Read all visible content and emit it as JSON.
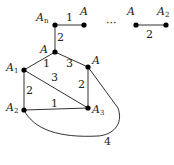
{
  "diagram": {
    "nodes": [
      {
        "id": "An_top",
        "label": "A",
        "sub": "n",
        "x": 55,
        "y": 25,
        "lx": 36,
        "ly": 21
      },
      {
        "id": "A_top",
        "label": "A",
        "sub": "",
        "x": 84,
        "y": 25,
        "lx": 80,
        "ly": 15
      },
      {
        "id": "A_rightgrp",
        "label": "A",
        "sub": "",
        "x": 136,
        "y": 25,
        "lx": 127,
        "ly": 15
      },
      {
        "id": "A2_rightgrp",
        "label": "A",
        "sub": "2",
        "x": 166,
        "y": 25,
        "lx": 157,
        "ly": 15
      },
      {
        "id": "A_center",
        "label": "A",
        "sub": "",
        "x": 55,
        "y": 52,
        "lx": 40,
        "ly": 53
      },
      {
        "id": "A1",
        "label": "A",
        "sub": "1",
        "x": 24,
        "y": 70,
        "lx": 6,
        "ly": 71
      },
      {
        "id": "A_right",
        "label": "A",
        "sub": "",
        "x": 88,
        "y": 67,
        "lx": 92,
        "ly": 64
      },
      {
        "id": "A2",
        "label": "A",
        "sub": "2",
        "x": 24,
        "y": 110,
        "lx": 6,
        "ly": 111
      },
      {
        "id": "A3",
        "label": "A",
        "sub": "3",
        "x": 88,
        "y": 108,
        "lx": 92,
        "ly": 113
      }
    ],
    "edges": [
      {
        "from": "An_top",
        "to": "A_top",
        "weight": "1",
        "wx": 66,
        "wy": 21
      },
      {
        "from": "A_rightgrp",
        "to": "A2_rightgrp",
        "weight": "2",
        "wx": 146,
        "wy": 38
      },
      {
        "from": "An_top",
        "to": "A_center",
        "weight": "2",
        "wx": 57,
        "wy": 41
      },
      {
        "from": "A_center",
        "to": "A1",
        "weight": "1",
        "wx": 43,
        "wy": 67
      },
      {
        "from": "A_center",
        "to": "A_right",
        "weight": "3",
        "wx": 66,
        "wy": 67
      },
      {
        "from": "A1",
        "to": "A3",
        "weight": "3",
        "wx": 51,
        "wy": 81
      },
      {
        "from": "A1",
        "to": "A2",
        "weight": "2",
        "wx": 26,
        "wy": 94
      },
      {
        "from": "A_right",
        "to": "A3",
        "weight": "2",
        "wx": 78,
        "wy": 88
      },
      {
        "from": "A2",
        "to": "A3",
        "weight": "1",
        "wx": 51,
        "wy": 107
      },
      {
        "from": "A_right",
        "to": "A2",
        "weight": "4",
        "wx": 104,
        "wy": 145,
        "curved": true
      }
    ],
    "ellipsis": {
      "text": "···",
      "x": 106,
      "y": 27
    }
  }
}
